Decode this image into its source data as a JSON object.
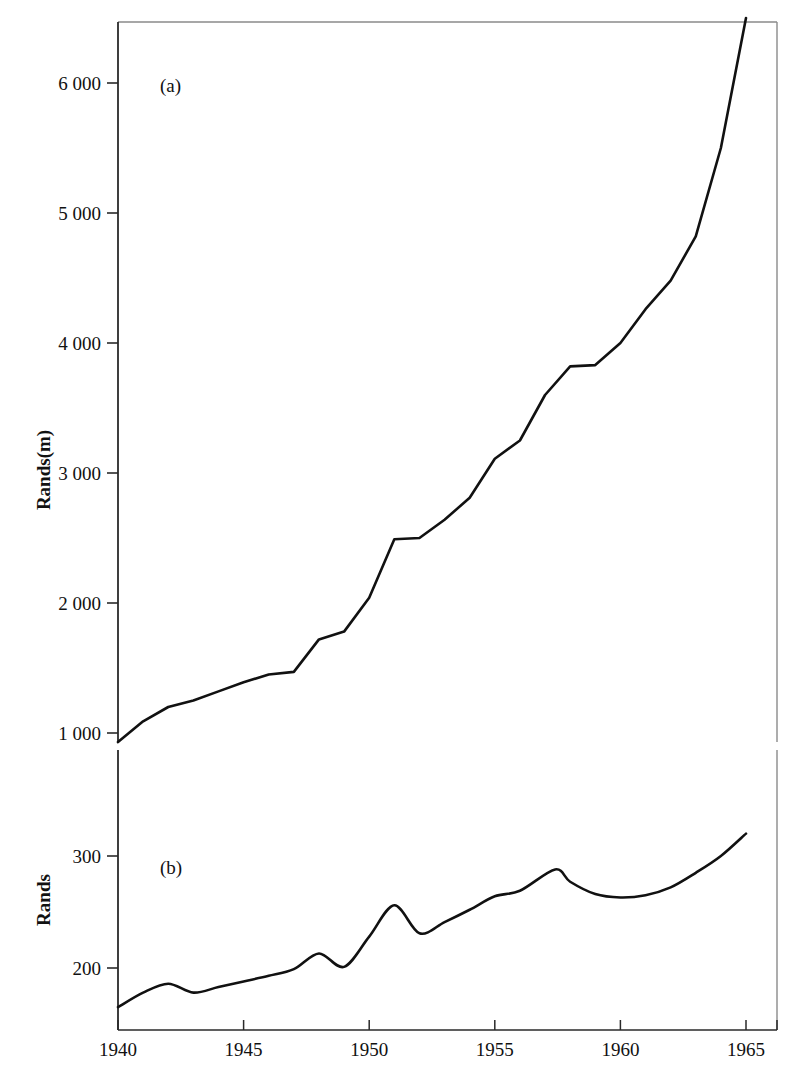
{
  "figure": {
    "background": "#ffffff",
    "line_color": "#111111",
    "axis_color": "#222222",
    "border_color": "#8a8a8a"
  },
  "panels": [
    {
      "id": "a",
      "label": "(a)",
      "ylabel": "Rands(m)",
      "ytick_labels": [
        "6 000",
        "5 000",
        "4 000",
        "3 000",
        "2 000",
        "1 000"
      ]
    },
    {
      "id": "b",
      "label": "(b)",
      "ylabel": "Rands",
      "ytick_labels": [
        "300",
        "200"
      ]
    }
  ],
  "xtick_labels": [
    "1940",
    "1945",
    "1950",
    "1955",
    "1960",
    "1965"
  ],
  "chart_data": [
    {
      "type": "line",
      "title": "(a)",
      "xlabel": "",
      "ylabel": "Rands(m)",
      "xlim": [
        1940,
        1966.3
      ],
      "ylim": [
        730,
        6500
      ],
      "yticks": [
        1000,
        2000,
        3000,
        4000,
        5000,
        6000
      ],
      "ytick_labels": [
        "1 000",
        "2 000",
        "3 000",
        "4 000",
        "5 000",
        "6 000"
      ],
      "xticks": [
        1940,
        1945,
        1950,
        1955,
        1960,
        1965
      ],
      "grid": false,
      "legend": "none",
      "x": [
        1940,
        1941,
        1942,
        1943,
        1944,
        1945,
        1946,
        1947,
        1948,
        1949,
        1950,
        1951,
        1952,
        1953,
        1954,
        1955,
        1956,
        1957,
        1958,
        1959,
        1960,
        1961,
        1962,
        1963,
        1964,
        1965
      ],
      "values": [
        930,
        1090,
        1200,
        1250,
        1320,
        1390,
        1450,
        1470,
        1720,
        1780,
        2040,
        2490,
        2500,
        2640,
        2810,
        3110,
        3250,
        3600,
        3820,
        3830,
        4000,
        4260,
        4480,
        4820,
        5500,
        6500
      ]
    },
    {
      "type": "line",
      "title": "(b)",
      "xlabel": "",
      "ylabel": "Rands",
      "xlim": [
        1940,
        1966.3
      ],
      "ylim": [
        155,
        340
      ],
      "yticks": [
        200,
        300
      ],
      "ytick_labels": [
        "200",
        "300"
      ],
      "xticks": [
        1940,
        1945,
        1950,
        1955,
        1960,
        1965
      ],
      "grid": false,
      "legend": "none",
      "x": [
        1940,
        1941,
        1942,
        1943,
        1944,
        1945,
        1946,
        1947,
        1948,
        1949,
        1950,
        1951,
        1952,
        1953,
        1954,
        1955,
        1956,
        1957.4,
        1958,
        1959,
        1960,
        1961,
        1962,
        1963,
        1964,
        1965
      ],
      "values": [
        165,
        178,
        186,
        178,
        183,
        188,
        193,
        199,
        213,
        201,
        228,
        256,
        231,
        241,
        252,
        264,
        269,
        288,
        277,
        266,
        263,
        265,
        272,
        285,
        300,
        320
      ]
    }
  ]
}
